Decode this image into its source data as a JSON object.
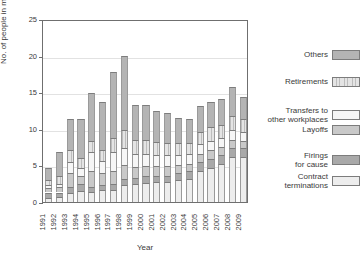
{
  "chart_data": {
    "type": "bar",
    "subtype": "stacked-bar",
    "title": "",
    "xlabel": "Year",
    "ylabel": "No. of people in million",
    "ylim": [
      0,
      25
    ],
    "yticks": [
      0,
      5,
      10,
      15,
      20,
      25
    ],
    "grid": true,
    "legend_position": "right",
    "categories": [
      "1991",
      "1992",
      "1993",
      "1994",
      "1995",
      "1996",
      "1997",
      "1998",
      "1999",
      "2000",
      "2001",
      "2002",
      "2003",
      "2004",
      "2005",
      "2006",
      "2007",
      "2008",
      "2009"
    ],
    "series": [
      {
        "name": "Contract terminations",
        "color": "#ededed",
        "values": [
          0.6,
          0.7,
          1.2,
          1.5,
          1.3,
          1.6,
          1.7,
          2.3,
          2.5,
          2.6,
          2.7,
          2.8,
          3.0,
          3.2,
          4.2,
          4.6,
          5.2,
          6.1,
          6.2
        ]
      },
      {
        "name": "Firings for cause",
        "color": "#a9a9a9",
        "values": [
          0.7,
          0.6,
          0.8,
          0.9,
          0.8,
          0.7,
          0.7,
          0.8,
          0.8,
          0.9,
          0.9,
          0.8,
          0.9,
          1.0,
          1.2,
          1.3,
          1.2,
          1.3,
          1.2
        ]
      },
      {
        "name": "Layoffs",
        "color": "#c9c9c9",
        "values": [
          0.6,
          0.7,
          1.9,
          1.1,
          2.1,
          1.7,
          1.9,
          1.9,
          1.5,
          1.4,
          1.3,
          1.3,
          1.1,
          1.0,
          1.2,
          1.2,
          1.1,
          1.1,
          1.0
        ]
      },
      {
        "name": "Transfers to other workplaces",
        "color": "#f6f6f6",
        "values": [
          0.4,
          0.4,
          1.6,
          1.1,
          2.6,
          1.6,
          2.5,
          2.4,
          1.8,
          1.7,
          1.5,
          1.5,
          1.4,
          1.3,
          1.3,
          1.3,
          1.2,
          1.3,
          1.2
        ]
      },
      {
        "name": "Retirements",
        "color": "#d2d2d2",
        "values": [
          0.7,
          1.1,
          1.6,
          1.4,
          1.5,
          1.5,
          2.0,
          2.4,
          1.9,
          1.9,
          1.8,
          1.7,
          1.6,
          1.5,
          1.7,
          1.8,
          1.8,
          1.9,
          1.8
        ]
      },
      {
        "name": "Others",
        "color": "#b4b4b4",
        "values": [
          1.7,
          3.3,
          4.2,
          5.4,
          6.6,
          6.6,
          8.9,
          10.2,
          4.8,
          4.7,
          4.3,
          4.0,
          3.5,
          3.3,
          3.5,
          3.5,
          3.6,
          4.0,
          3.0
        ]
      }
    ],
    "totals": [
      4.7,
      6.8,
      11.3,
      11.4,
      14.9,
      13.7,
      18.7,
      20.0,
      13.3,
      13.2,
      12.5,
      12.1,
      11.5,
      11.3,
      13.1,
      13.7,
      14.1,
      15.7,
      14.4
    ]
  },
  "legend": {
    "entries": [
      {
        "label": "Others",
        "swatch": "others-swatch"
      },
      {
        "label": "Retirements",
        "swatch": "retirements-swatch"
      },
      {
        "label": "Transfers to\nother workplaces",
        "swatch": "transfers-swatch"
      },
      {
        "label": "Layoffs",
        "swatch": "layoffs-swatch"
      },
      {
        "label": "Firings\nfor cause",
        "swatch": "firings-swatch"
      },
      {
        "label": "Contract\nterminations",
        "swatch": "contract-swatch"
      }
    ]
  },
  "colors": {
    "axis": "#6f6f6f",
    "grid": "#e2e2e2",
    "text": "#3a3a3a",
    "background": "#ffffff"
  }
}
